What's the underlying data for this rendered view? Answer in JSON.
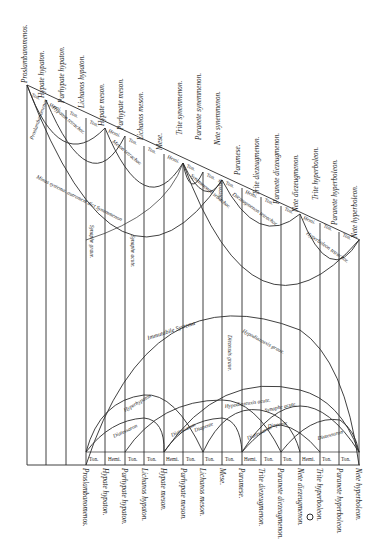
{
  "diagram": {
    "orientation": "rotated-90",
    "ink_color": "#2b2b2b",
    "paper_color": "#ffffff",
    "top_notes": [
      "Proslambanomenos.",
      "Hypate hypaton.",
      "Parhypate hypaton.",
      "Lichanos hypaton.",
      "Hypate meson.",
      "Parhypate meson.",
      "Lichanos meson.",
      "Mese.",
      "Trite synemmenon.",
      "Paranete synemmenon.",
      "Nete synemmenon.",
      "Paramese.",
      "Trite diezeugmenon.",
      "Paranete diezeugmenon.",
      "Nete diezeugmenon.",
      "Trite hyperboleon.",
      "Paranete hyperboleon.",
      "Nete hyperboleon."
    ],
    "top_cells": [
      "Ton.",
      "Hemi.",
      "Ton.",
      "Ton.",
      "Hemi.",
      "Ton.",
      "Ton.",
      "Hemi.",
      "Ton.",
      "Ton.",
      "Ton.",
      "Hemi.",
      "Ton.",
      "Ton.",
      "Hemi.",
      "Ton.",
      "Ton."
    ],
    "top_arcs": {
      "hypaton_tetrachord": "Hypaton tetrachor.",
      "meson_tetrachord": "Meson tetrachor.",
      "synemmenon_tetrachord": "Synemmenon tetrachor.",
      "diezeugmenon_tetrachord": "Diezeugmenon tetrachor.",
      "hyperboleon_tetrachord": "Hyperboleon tetrachor.",
      "proslambanomenos_label": "Proslambanomenos",
      "diezeuxis_label": "Diezeuxis",
      "outer_system": "Minus systema, autrement dict Synemmenon",
      "synaphe_graue": "Synaphe graue.",
      "synaphe_acute": "Synaphe acute."
    },
    "bottom_notes": [
      "Proslambanomenos.",
      "Hypate hypaton.",
      "Parhypate hypaton.",
      "Lichanos hypaton.",
      "Hypate meson.",
      "Parhypate meson.",
      "Lichanos meson.",
      "Mese.",
      "Paramese.",
      "Trite diezeugmenon.",
      "Paranete diezeugmenon.",
      "Nete diezeugmenon.",
      "Trite hyperboleon.",
      "Paranete hyperboleon.",
      "Nete hyperboleon."
    ],
    "bottom_cells": [
      "Ton.",
      "Hemi.",
      "Ton.",
      "Ton.",
      "Hemi.",
      "Ton.",
      "Ton.",
      "Ton.",
      "Hemi.",
      "Ton.",
      "Ton.",
      "Hemi.",
      "Ton.",
      "Ton."
    ],
    "bottom_arcs": {
      "immutable_system": "Immutabile Systema",
      "hypodiazeuxis_graue": "Hypodiazeuxis graue.",
      "diezeuxis_graue": "Diezeuxis graue.",
      "hypodiazeuxis_acute": "Hypodiazeuxis acute.",
      "synaphe_acute": "Synaphe acute.",
      "hyperhypaton": "Hyperhypaton",
      "diatessaron_1": "Diatessaron",
      "diatessaron_2": "Diatessaron",
      "diatessaron_3": "Diatessaron",
      "diatessaron_4": "Diatessaron",
      "diapente_1": "Diapente",
      "diapente_2": "Diapente"
    },
    "marker": "circle"
  }
}
